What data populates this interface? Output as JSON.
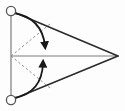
{
  "figure": {
    "background_color": "#fdfdfd",
    "width": 125,
    "height": 111
  },
  "colors": {
    "solid_edge": "#2b2b2b",
    "guide_line": "#7d7d7d",
    "dashed_line": "#8c8c8c",
    "arrow": "#1a1a1a",
    "node_stroke": "#555555",
    "node_fill": "#ffffff"
  },
  "chart_data": {
    "type": "diagram",
    "points": [
      {
        "id": "A",
        "label": "top-left-node",
        "x": 11,
        "y": 11,
        "marker": "open-circle"
      },
      {
        "id": "B",
        "label": "bottom-left-node",
        "x": 11,
        "y": 100,
        "marker": "open-circle"
      },
      {
        "id": "C",
        "label": "right-apex",
        "x": 118,
        "y": 56,
        "marker": "none"
      },
      {
        "id": "M",
        "label": "mid-left-origin",
        "x": 11,
        "y": 56,
        "marker": "none"
      }
    ],
    "solid_edges": [
      {
        "name": "upper-edge",
        "from": "A",
        "to": "C",
        "style": "solid",
        "color": "#2b2b2b",
        "width": 1.6
      },
      {
        "name": "lower-edge",
        "from": "B",
        "to": "C",
        "style": "solid",
        "color": "#2b2b2b",
        "width": 1.6
      }
    ],
    "guide_lines": [
      {
        "name": "left-vertical-baseline",
        "x1": 11,
        "y1": 11,
        "x2": 11,
        "y2": 100,
        "style": "solid",
        "color": "#7d7d7d",
        "width": 1.2
      },
      {
        "name": "horizontal-axis",
        "x1": 11,
        "y1": 56,
        "x2": 118,
        "y2": 56,
        "style": "solid",
        "color": "#7d7d7d",
        "width": 1.2
      }
    ],
    "dashed_rays": [
      {
        "name": "upper-dashed-ray",
        "x1": 11,
        "y1": 56,
        "x2": 50,
        "y2": 24,
        "style": "dashed",
        "color": "#8c8c8c",
        "width": 1.0,
        "dash": "2.4 2.4"
      },
      {
        "name": "lower-dashed-ray",
        "x1": 11,
        "y1": 56,
        "x2": 50,
        "y2": 88,
        "style": "dashed",
        "color": "#8c8c8c",
        "width": 1.0,
        "dash": "2.4 2.4"
      }
    ],
    "curved_arrows": [
      {
        "name": "upper-rotation-arrow",
        "from": "A",
        "start": {
          "x": 14,
          "y": 13
        },
        "control": {
          "x": 42,
          "y": 18
        },
        "end": {
          "x": 45,
          "y": 46
        },
        "direction": "clockwise-downward",
        "arrowhead": "filled-triangle",
        "color": "#1a1a1a",
        "width": 1.8
      },
      {
        "name": "lower-rotation-arrow",
        "from": "B",
        "start": {
          "x": 14,
          "y": 98
        },
        "control": {
          "x": 42,
          "y": 93
        },
        "end": {
          "x": 43,
          "y": 63
        },
        "direction": "counterclockwise-upward",
        "arrowhead": "filled-triangle",
        "color": "#1a1a1a",
        "width": 1.8
      }
    ],
    "annotations": [],
    "legend": [],
    "grid": false,
    "axis_labels": {
      "x": "",
      "y": ""
    }
  }
}
